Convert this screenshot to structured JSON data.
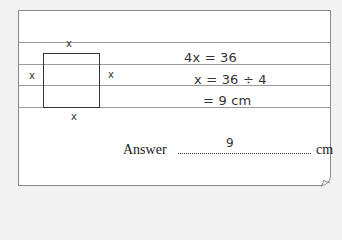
{
  "figure": {
    "side_labels": {
      "top": "x",
      "left": "x",
      "right": "x",
      "bottom": "x"
    }
  },
  "working": {
    "lines": [
      "4x = 36",
      "x = 36 ÷ 4",
      "= 9 cm"
    ]
  },
  "answer": {
    "label": "Answer",
    "value": "9",
    "unit": "cm"
  }
}
